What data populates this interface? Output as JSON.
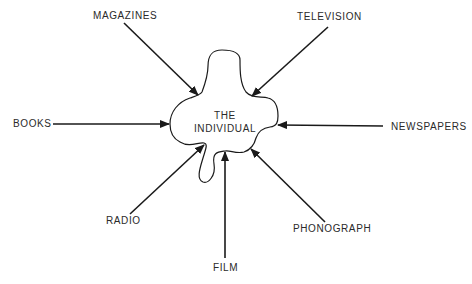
{
  "diagram": {
    "center": {
      "line1": "THE",
      "line2": "INDIVIDUAL"
    },
    "media": [
      {
        "id": "magazines",
        "label": "MAGAZINES"
      },
      {
        "id": "television",
        "label": "TELEVISION"
      },
      {
        "id": "books",
        "label": "BOOKS"
      },
      {
        "id": "newspapers",
        "label": "NEWSPAPERS"
      },
      {
        "id": "radio",
        "label": "RADIO"
      },
      {
        "id": "phonograph",
        "label": "PHONOGRAPH"
      },
      {
        "id": "film",
        "label": "FILM"
      }
    ],
    "colors": {
      "line": "#1a1a1a",
      "text": "#2a2a2a",
      "background": "#ffffff"
    }
  }
}
